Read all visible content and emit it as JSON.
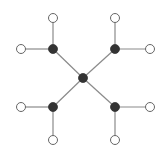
{
  "diagram": {
    "type": "tree-graph",
    "colors": {
      "background": "#ffffff",
      "edge": "#8a8a8a",
      "filled_node": "#333333",
      "open_node_stroke": "#666666",
      "open_node_fill": "#ffffff"
    },
    "nodes": [
      {
        "id": "center",
        "x": 83,
        "y": 78,
        "kind": "filled"
      },
      {
        "id": "tl",
        "x": 53,
        "y": 49,
        "kind": "filled"
      },
      {
        "id": "tr",
        "x": 115,
        "y": 49,
        "kind": "filled"
      },
      {
        "id": "bl",
        "x": 53,
        "y": 107,
        "kind": "filled"
      },
      {
        "id": "br",
        "x": 115,
        "y": 107,
        "kind": "filled"
      },
      {
        "id": "tl-top",
        "x": 53,
        "y": 18,
        "kind": "open"
      },
      {
        "id": "tl-left",
        "x": 21,
        "y": 49,
        "kind": "open"
      },
      {
        "id": "tr-top",
        "x": 115,
        "y": 18,
        "kind": "open"
      },
      {
        "id": "tr-right",
        "x": 150,
        "y": 49,
        "kind": "open"
      },
      {
        "id": "bl-left",
        "x": 21,
        "y": 107,
        "kind": "open"
      },
      {
        "id": "bl-bottom",
        "x": 53,
        "y": 140,
        "kind": "open"
      },
      {
        "id": "br-right",
        "x": 150,
        "y": 107,
        "kind": "open"
      },
      {
        "id": "br-bottom",
        "x": 115,
        "y": 140,
        "kind": "open"
      }
    ],
    "edges": [
      [
        "center",
        "tl"
      ],
      [
        "center",
        "tr"
      ],
      [
        "center",
        "bl"
      ],
      [
        "center",
        "br"
      ],
      [
        "tl",
        "tl-top"
      ],
      [
        "tl",
        "tl-left"
      ],
      [
        "tr",
        "tr-top"
      ],
      [
        "tr",
        "tr-right"
      ],
      [
        "bl",
        "bl-left"
      ],
      [
        "bl",
        "bl-bottom"
      ],
      [
        "br",
        "br-right"
      ],
      [
        "br",
        "br-bottom"
      ]
    ]
  }
}
